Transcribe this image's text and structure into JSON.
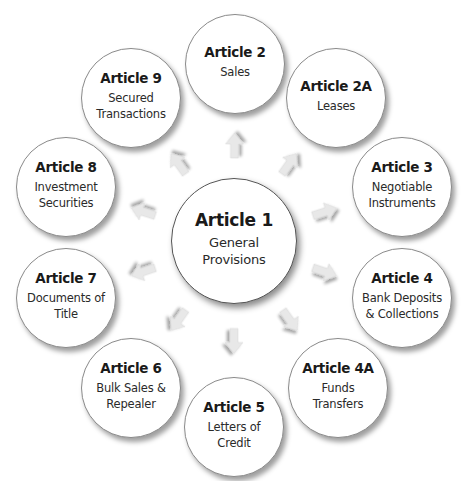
{
  "diagram": {
    "type": "hub-and-spoke",
    "center": {
      "id": "article-1",
      "title": "Article 1",
      "subtitle_lines": [
        "General",
        "Provisions"
      ]
    },
    "nodes": [
      {
        "id": "article-2",
        "title": "Article 2",
        "subtitle_lines": [
          "Sales"
        ]
      },
      {
        "id": "article-2a",
        "title": "Article 2A",
        "subtitle_lines": [
          "Leases"
        ]
      },
      {
        "id": "article-3",
        "title": "Article 3",
        "subtitle_lines": [
          "Negotiable",
          "Instruments"
        ]
      },
      {
        "id": "article-4",
        "title": "Article 4",
        "subtitle_lines": [
          "Bank Deposits",
          "& Collections"
        ]
      },
      {
        "id": "article-4a",
        "title": "Article 4A",
        "subtitle_lines": [
          "Funds",
          "Transfers"
        ]
      },
      {
        "id": "article-5",
        "title": "Article 5",
        "subtitle_lines": [
          "Letters of",
          "Credit"
        ]
      },
      {
        "id": "article-6",
        "title": "Article 6",
        "subtitle_lines": [
          "Bulk Sales &",
          "Repealer"
        ]
      },
      {
        "id": "article-7",
        "title": "Article 7",
        "subtitle_lines": [
          "Documents of",
          "Title"
        ]
      },
      {
        "id": "article-8",
        "title": "Article 8",
        "subtitle_lines": [
          "Investment",
          "Securities"
        ]
      },
      {
        "id": "article-9",
        "title": "Article 9",
        "subtitle_lines": [
          "Secured",
          "Transactions"
        ]
      }
    ],
    "edges": [
      {
        "from": "article-1",
        "to": "article-2",
        "style": "arrow"
      },
      {
        "from": "article-1",
        "to": "article-2a",
        "style": "arrow"
      },
      {
        "from": "article-1",
        "to": "article-3",
        "style": "arrow"
      },
      {
        "from": "article-1",
        "to": "article-4",
        "style": "arrow"
      },
      {
        "from": "article-1",
        "to": "article-4a",
        "style": "arrow"
      },
      {
        "from": "article-1",
        "to": "article-5",
        "style": "arrow"
      },
      {
        "from": "article-1",
        "to": "article-6",
        "style": "arrow"
      },
      {
        "from": "article-1",
        "to": "article-7",
        "style": "arrow"
      },
      {
        "from": "article-1",
        "to": "article-8",
        "style": "arrow"
      },
      {
        "from": "article-1",
        "to": "article-9",
        "style": "arrow"
      }
    ],
    "colors": {
      "circle_fill": "#ffffff",
      "circle_border": "#8a8a8a",
      "arrow_fill": "#e8e8e8",
      "text": "#1a1a1a"
    }
  }
}
